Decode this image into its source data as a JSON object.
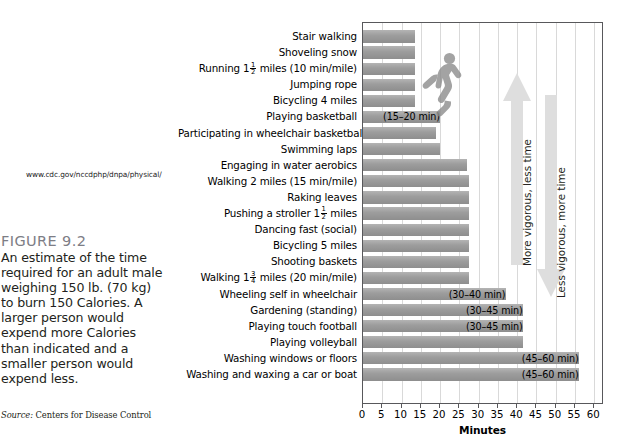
{
  "caption": {
    "url": "www.cdc.gov/nccdphp/dnpa/physical/",
    "figure_number": "FIGURE 9.2",
    "figure_text": "An estimate of the time required for an adult male weighing 150 lb. (70 kg) to burn 150 Calories. A larger person would expend more Calories than indicated and a smaller person would expend less.",
    "source_label": "Source:",
    "source_text": " Centers for Disease Control"
  },
  "annotations": {
    "up_arrow_label": "More vigorous, less time",
    "down_arrow_label": "Less vigorous, more time",
    "runner_icon": "running-person-silhouette"
  },
  "colors": {
    "bar_fill": "#9d9d9d",
    "bar_fill_light": "#b4b4b4",
    "gridline": "#d9d9d9",
    "plot_border": "#58585b",
    "figure_number": "#7d7d85",
    "arrow": "#dcdcdc"
  },
  "chart_data": {
    "type": "bar",
    "orientation": "horizontal",
    "title": "",
    "xlabel": "Minutes",
    "ylabel": "",
    "xlim": [
      0,
      62
    ],
    "xticks": [
      0,
      5,
      10,
      15,
      20,
      25,
      30,
      35,
      40,
      45,
      50,
      55,
      60
    ],
    "grid": "vertical",
    "legend": "none",
    "categories": [
      "Stair walking",
      "Shoveling snow",
      "Running 1½ miles (10 min/mile)",
      "Jumping rope",
      "Bicycling 4 miles",
      "Playing basketball",
      "Participating in wheelchair basketball",
      "Swimming laps",
      "Engaging in water aerobics",
      "Walking 2 miles (15 min/mile)",
      "Raking leaves",
      "Pushing a stroller 1½ miles",
      "Dancing fast (social)",
      "Bicycling 5 miles",
      "Shooting baskets",
      "Walking 1¾ miles (20 min/mile)",
      "Wheeling self in wheelchair",
      "Gardening (standing)",
      "Playing touch football",
      "Playing volleyball",
      "Washing windows or floors",
      "Washing and waxing a car or boat"
    ],
    "values": [
      13.5,
      13.5,
      13.5,
      13.5,
      13.5,
      20,
      19,
      20,
      27,
      27.5,
      27.5,
      27.5,
      27.5,
      27.5,
      27.5,
      27.5,
      37,
      41.5,
      41.5,
      41.5,
      56,
      56
    ],
    "bar_notes": [
      null,
      null,
      null,
      null,
      null,
      "(15–20 min)",
      null,
      null,
      null,
      null,
      null,
      null,
      null,
      null,
      null,
      null,
      "(30–40 min)",
      "(30–45 min)",
      "(30–45 min)",
      null,
      "(45–60 min)",
      "(45–60 min)"
    ]
  },
  "categories_rich": [
    {
      "pre": "Stair walking",
      "frac": null,
      "post": ""
    },
    {
      "pre": "Shoveling snow",
      "frac": null,
      "post": ""
    },
    {
      "pre": "Running ",
      "frac": {
        "whole": "1",
        "num": "1",
        "den": "2"
      },
      "post": " miles (10 min/mile)"
    },
    {
      "pre": "Jumping rope",
      "frac": null,
      "post": ""
    },
    {
      "pre": "Bicycling 4 miles",
      "frac": null,
      "post": ""
    },
    {
      "pre": "Playing basketball",
      "frac": null,
      "post": ""
    },
    {
      "pre": "Participating in wheelchair basketball",
      "frac": null,
      "post": ""
    },
    {
      "pre": "Swimming laps",
      "frac": null,
      "post": ""
    },
    {
      "pre": "Engaging in water aerobics",
      "frac": null,
      "post": ""
    },
    {
      "pre": "Walking 2 miles (15 min/mile)",
      "frac": null,
      "post": ""
    },
    {
      "pre": "Raking leaves",
      "frac": null,
      "post": ""
    },
    {
      "pre": "Pushing a stroller ",
      "frac": {
        "whole": "1",
        "num": "1",
        "den": "2"
      },
      "post": " miles"
    },
    {
      "pre": "Dancing fast (social)",
      "frac": null,
      "post": ""
    },
    {
      "pre": "Bicycling 5 miles",
      "frac": null,
      "post": ""
    },
    {
      "pre": "Shooting baskets",
      "frac": null,
      "post": ""
    },
    {
      "pre": "Walking ",
      "frac": {
        "whole": "1",
        "num": "3",
        "den": "4"
      },
      "post": " miles (20 min/mile)"
    },
    {
      "pre": "Wheeling self in wheelchair",
      "frac": null,
      "post": ""
    },
    {
      "pre": "Gardening (standing)",
      "frac": null,
      "post": ""
    },
    {
      "pre": "Playing touch football",
      "frac": null,
      "post": ""
    },
    {
      "pre": "Playing volleyball",
      "frac": null,
      "post": ""
    },
    {
      "pre": "Washing windows or floors",
      "frac": null,
      "post": ""
    },
    {
      "pre": "Washing and waxing a car or boat",
      "frac": null,
      "post": ""
    }
  ]
}
